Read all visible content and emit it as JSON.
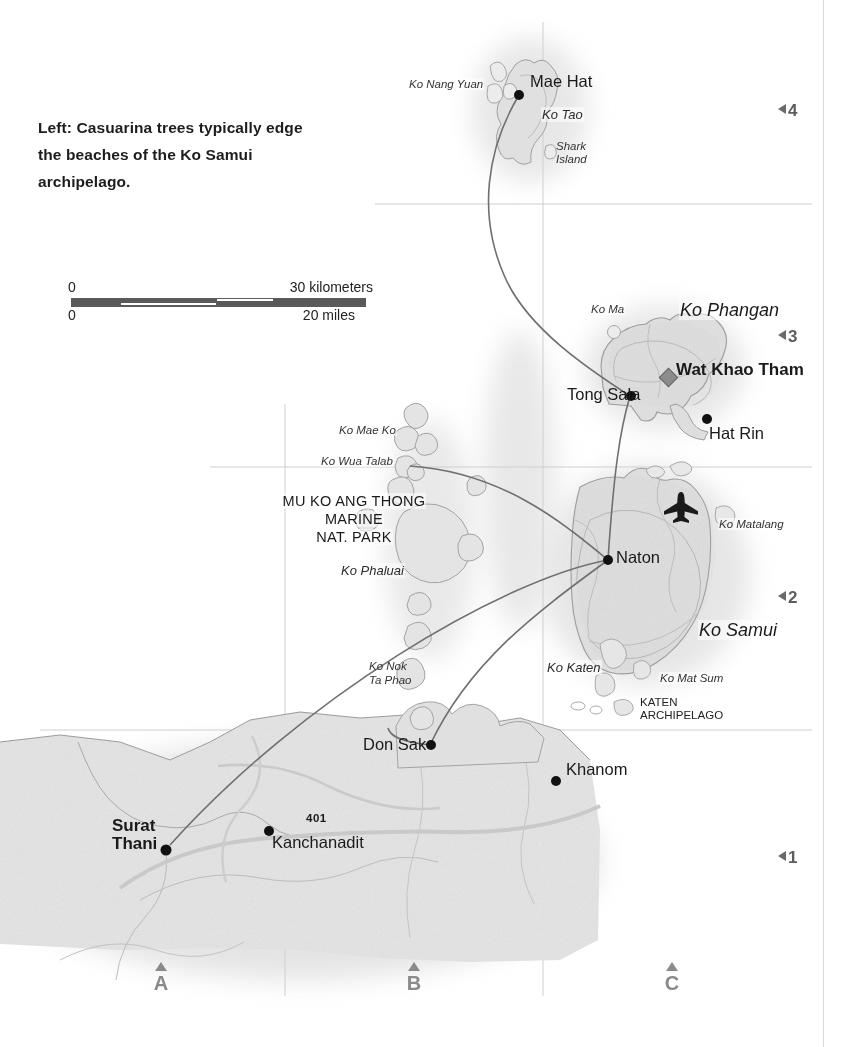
{
  "caption": {
    "text": "Left: Casuarina trees typically edge the beaches of the Ko Samui archipelago."
  },
  "scale": {
    "km_zero": "0",
    "km_label": "30 kilometers",
    "mi_zero": "0",
    "mi_label": "20 miles"
  },
  "towns": [
    {
      "name": "Mae Hat",
      "bold": false
    },
    {
      "name": "Tong Sala",
      "bold": false
    },
    {
      "name": "Hat Rin",
      "bold": false
    },
    {
      "name": "Wat Khao Tham",
      "bold": true
    },
    {
      "name": "Naton",
      "bold": false
    },
    {
      "name": "Don Sak",
      "bold": false
    },
    {
      "name": "Khanom",
      "bold": false
    },
    {
      "name": "Kanchanadit",
      "bold": false
    },
    {
      "name": "Surat Thani",
      "bold": true
    }
  ],
  "town_labels": {
    "mae_hat": "Mae Hat",
    "tong_sala": "Tong Sala",
    "hat_rin": "Hat Rin",
    "wat_khao_tham": "Wat Khao Tham",
    "naton": "Naton",
    "don_sak": "Don Sak",
    "khanom": "Khanom",
    "kanchanadit": "Kanchanadit",
    "surat_1": "Surat",
    "surat_2": "Thani"
  },
  "islands": {
    "ko_nang_yuan": "Ko Nang Yuan",
    "ko_tao": "Ko Tao",
    "shark_island_1": "Shark",
    "shark_island_2": "Island",
    "ko_ma": "Ko Ma",
    "ko_phangan": "Ko Phangan",
    "ko_samui": "Ko Samui",
    "ko_matalang": "Ko Matalang",
    "ko_katen": "Ko Katen",
    "ko_mat_sum": "Ko Mat Sum",
    "ko_mae_ko": "Ko Mae Ko",
    "ko_wua_talab": "Ko Wua Talab",
    "ko_phaluai": "Ko Phaluai",
    "ko_nok_1": "Ko Nok",
    "ko_nok_2": "Ta Phao",
    "katen_arch_1": "KATEN",
    "katen_arch_2": "ARCHIPELAGO"
  },
  "park": {
    "line1": "MU KO ANG THONG",
    "line2": "MARINE",
    "line3": "NAT. PARK"
  },
  "roads": {
    "route_401": "401"
  },
  "grid": {
    "rows": [
      "4",
      "3",
      "2",
      "1"
    ],
    "cols": [
      "A",
      "B",
      "C"
    ]
  },
  "icons": {
    "airport": "airplane-icon",
    "temple": "temple-diamond-icon",
    "grid_row_arrow": "triangle-left-icon",
    "grid_col_arrow": "triangle-up-icon"
  },
  "colors": {
    "land": "#e2e2e2",
    "island": "#dcdcdc",
    "coastline": "#8e8e8e",
    "route": "#6f6f6f",
    "grid": "#cfcfcf",
    "text": "#1a1a1a",
    "grid_index": "#6a6a6a",
    "scale_dark": "#5a5a5a"
  }
}
